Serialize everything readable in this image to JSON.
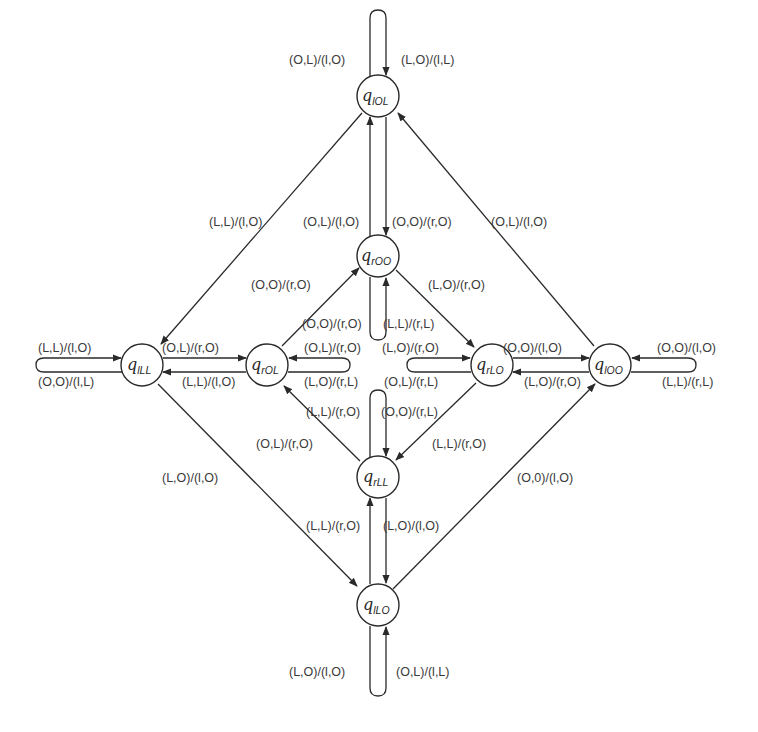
{
  "diagram": {
    "type": "state-machine",
    "colors": {
      "stroke": "#2a2a2a",
      "text": "#3a3a3a",
      "background": "#ffffff"
    },
    "nodes": [
      {
        "id": "lOL",
        "symbol": "q",
        "subscript": "lOL",
        "x": 378,
        "y": 96
      },
      {
        "id": "rOO",
        "symbol": "q",
        "subscript": "rOO",
        "x": 378,
        "y": 256
      },
      {
        "id": "lLL",
        "symbol": "q",
        "subscript": "lLL",
        "x": 142,
        "y": 365
      },
      {
        "id": "rOL",
        "symbol": "q",
        "subscript": "rOL",
        "x": 267,
        "y": 365
      },
      {
        "id": "rLO",
        "symbol": "q",
        "subscript": "rLO",
        "x": 492,
        "y": 365
      },
      {
        "id": "lOO",
        "symbol": "q",
        "subscript": "lOO",
        "x": 610,
        "y": 365
      },
      {
        "id": "rLL",
        "symbol": "q",
        "subscript": "rLL",
        "x": 378,
        "y": 477
      },
      {
        "id": "lLO",
        "symbol": "q",
        "subscript": "lLO",
        "x": 378,
        "y": 605
      }
    ],
    "edges": [
      {
        "from": "lOL",
        "to": "lOL",
        "labels": [
          "(O,L)/(l,O)",
          "(L,O)/(l,L)"
        ]
      },
      {
        "from": "lOL",
        "to": "rOO",
        "labels": [
          "(O,O)/(r,O)"
        ]
      },
      {
        "from": "rOO",
        "to": "lOL",
        "labels": [
          "(O,L)/(l,O)"
        ]
      },
      {
        "from": "lOL",
        "to": "lLL",
        "labels": [
          "(L,L)/(l,O)"
        ]
      },
      {
        "from": "lOO",
        "to": "lOL",
        "labels": [
          "(O,L)/(l,O)"
        ]
      },
      {
        "from": "rOL",
        "to": "rOO",
        "labels": [
          "(O,O)/(r,O)"
        ]
      },
      {
        "from": "rOO",
        "to": "rLO",
        "labels": [
          "(L,O)/(r,O)"
        ]
      },
      {
        "from": "rOO",
        "to": "rOO",
        "labels": [
          "(O,O)/(r,O)",
          "(L,L)/(r,L)"
        ]
      },
      {
        "from": "lLL",
        "to": "lLL",
        "labels": [
          "(L,L)/(l,O)",
          "(O,O)/(l,L)"
        ]
      },
      {
        "from": "lLL",
        "to": "rOL",
        "labels": [
          "(O,L)/(r,O)"
        ]
      },
      {
        "from": "rOL",
        "to": "lLL",
        "labels": [
          "(L,L)/(l,O)"
        ]
      },
      {
        "from": "rOL",
        "to": "rOL",
        "labels": [
          "(O,L)/(r,O)",
          "(L,O)/(r,L)"
        ]
      },
      {
        "from": "rLO",
        "to": "rLO",
        "labels": [
          "(L,O)/(r,O)",
          "(O,L)/(r,L)"
        ]
      },
      {
        "from": "rLO",
        "to": "lOO",
        "labels": [
          "(O,O)/(l,O)"
        ]
      },
      {
        "from": "lOO",
        "to": "rLO",
        "labels": [
          "(L,O)/(r,O)"
        ]
      },
      {
        "from": "lOO",
        "to": "lOO",
        "labels": [
          "(O,O)/(l,O)",
          "(L,L)/(r,L)"
        ]
      },
      {
        "from": "rLL",
        "to": "rOL",
        "labels": [
          "(O,L)/(r,O)"
        ]
      },
      {
        "from": "rLO",
        "to": "rLL",
        "labels": [
          "(L,L)/(r,O)"
        ]
      },
      {
        "from": "rLL",
        "to": "rLL",
        "labels": [
          "(L,L)/(r,O)",
          "(O,O)/(r,L)"
        ]
      },
      {
        "from": "lLO",
        "to": "rLL",
        "labels": [
          "(L,L)/(r,O)"
        ]
      },
      {
        "from": "rLL",
        "to": "lLO",
        "labels": [
          "(L,O)/(l,O)"
        ]
      },
      {
        "from": "lLL",
        "to": "lLO",
        "labels": [
          "(L,O)/(l,O)"
        ]
      },
      {
        "from": "lLO",
        "to": "lOO",
        "labels": [
          "(O,0)/(l,O)"
        ]
      },
      {
        "from": "lLO",
        "to": "lLO",
        "labels": [
          "(L,O)/(l,O)",
          "(O,L)/(l,L)"
        ]
      }
    ],
    "labels": {
      "top_loop_left": "(O,L)/(l,O)",
      "top_loop_right": "(L,O)/(l,L)",
      "lOL_to_lLL": "(L,L)/(l,O)",
      "rOO_to_lOL": "(O,L)/(l,O)",
      "lOL_to_rOO": "(O,O)/(r,O)",
      "lOO_to_lOL": "(O,L)/(l,O)",
      "rOL_to_rOO": "(O,O)/(r,O)",
      "rOO_to_rLO": "(L,O)/(r,O)",
      "rOO_loop_left": "(O,O)/(r,O)",
      "rOO_loop_right": "(L,L)/(r,L)",
      "lLL_loop_top": "(L,L)/(l,O)",
      "lLL_loop_bottom": "(O,O)/(l,L)",
      "lLL_to_rOL": "(O,L)/(r,O)",
      "rOL_to_lLL": "(L,L)/(l,O)",
      "rOL_loop_top": "(O,L)/(r,O)",
      "rOL_loop_bottom": "(L,O)/(r,L)",
      "rLO_loop_top": "(L,O)/(r,O)",
      "rLO_loop_bottom": "(O,L)/(r,L)",
      "rLO_to_lOO": "(O,O)/(l,O)",
      "lOO_to_rLO": "(L,O)/(r,O)",
      "lOO_loop_top": "(O,O)/(l,O)",
      "lOO_loop_bottom": "(L,L)/(r,L)",
      "rLL_loop_left": "(L,L)/(r,O)",
      "rLL_loop_right": "(O,O)/(r,L)",
      "rLL_to_rOL": "(O,L)/(r,O)",
      "rLO_to_rLL": "(L,L)/(r,O)",
      "lLL_to_lLO": "(L,O)/(l,O)",
      "lLO_to_lOO": "(O,0)/(l,O)",
      "lLO_to_rLL": "(L,L)/(r,O)",
      "rLL_to_lLO": "(L,O)/(l,O)",
      "bottom_loop_left": "(L,O)/(l,O)",
      "bottom_loop_right": "(O,L)/(l,L)"
    }
  }
}
